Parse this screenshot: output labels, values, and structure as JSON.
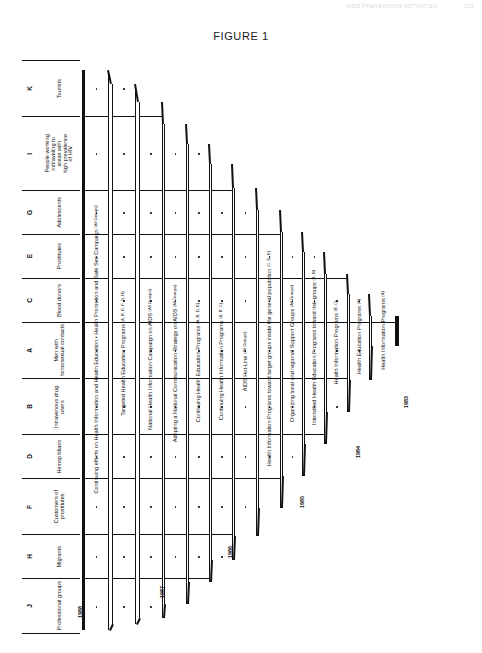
{
  "runhead": {
    "title": "AIDS PREVENTION ACTIVITIES",
    "page": "163"
  },
  "figure": {
    "caption_lead": "F",
    "caption_rest": "IGURE",
    "caption_num": "1",
    "caption_full": "FIGURE 1"
  },
  "axis": {
    "group_header_code": "Code",
    "group_header_name": "Target group",
    "groups": [
      {
        "code": "K",
        "name": "Tourists"
      },
      {
        "code": "I",
        "name": "People working in/traveling to areas with high prevalence of HIV"
      },
      {
        "code": "G",
        "name": "Adolescents"
      },
      {
        "code": "E",
        "name": "Prostitutes"
      },
      {
        "code": "C",
        "name": "Blood donors"
      },
      {
        "code": "A",
        "name": "Men with homosexual contacts"
      },
      {
        "code": "B",
        "name": "Intravenous drug users"
      },
      {
        "code": "D",
        "name": "Hemophiliacs"
      },
      {
        "code": "F",
        "name": "Customers of prostitutes"
      },
      {
        "code": "H",
        "name": "Migrants"
      },
      {
        "code": "J",
        "name": "Professional groups"
      }
    ]
  },
  "years": [
    "1988",
    "1987",
    "1986",
    "1985",
    "1984",
    "1983"
  ],
  "chart_data": {
    "type": "diagram",
    "title": "FIGURE 1",
    "xlabel": "Year",
    "ylabel": "Target groups",
    "categories": [
      "Tourists",
      "People working in/traveling to areas with high prevalence of HIV",
      "Adolescents",
      "Prostitutes",
      "Blood donors",
      "Men with homosexual contacts",
      "Intravenous drug users",
      "Hemophiliacs",
      "Customers of prostitutes",
      "Migrants",
      "Professional groups"
    ],
    "series": [
      {
        "name": "Continuing efforts on Health Information and Health Education • Health Promotion and Safe Sex Campaign",
        "groups": "All Groups",
        "year": "1988",
        "rows": 11
      },
      {
        "name": "Targeted Health Education Programs",
        "groups": "A, B, E, F, G, H",
        "year": "1988",
        "rows": 11
      },
      {
        "name": "National Health Information Campaign on AIDS",
        "groups": "All Groups",
        "year": "1987",
        "rows": 10
      },
      {
        "name": "Adopting a National Communication Strategy on AIDS",
        "groups": "All Groups",
        "year": "1987",
        "rows": 9
      },
      {
        "name": "Continuing Health Education Programs",
        "groups": "A, B, D, E",
        "year": "1987",
        "rows": 9
      },
      {
        "name": "Continuing Health Information Programs",
        "groups": "A, B, C",
        "year": "1986",
        "rows": 8
      },
      {
        "name": "AIDS Hot-Line",
        "groups": "All Groups",
        "year": "1986",
        "rows": 7
      },
      {
        "name": "Health Information Programs toward target groups inside the general population",
        "groups": "C, D, E",
        "year": "1986",
        "rows": 6
      },
      {
        "name": "Organizing local and regional Support Groups",
        "groups": "All Groups",
        "year": "1985",
        "rows": 5
      },
      {
        "name": "Intensified Health Education Programs toward risk-groups",
        "groups": "A, B",
        "year": "1985",
        "rows": 4
      },
      {
        "name": "Health Information Programs",
        "groups": "B, C",
        "year": "1984",
        "rows": 3
      },
      {
        "name": "Health Education Programs",
        "groups": "A",
        "year": "1984",
        "rows": 2
      },
      {
        "name": "Health Information Programs",
        "groups": "A",
        "year": "1983",
        "rows": 1
      }
    ]
  },
  "bands": [
    {
      "label": "Continuing efforts on Health Information and Health Education • Health Promotion and Safe Sex Campaign",
      "groups": "(All Groups)"
    },
    {
      "label": "Targeted Health Education Programs",
      "groups": "(A, B, E, F, G, H)"
    },
    {
      "label": "National Health Information Campaign on AIDS",
      "groups": "(All Groups)"
    },
    {
      "label": "Adopting a National Communication Strategy on AIDS",
      "groups": "(All Groups)"
    },
    {
      "label": "Continuing Health Education Programs",
      "groups": "(A, B, D, E)"
    },
    {
      "label": "Continuing Health Information Programs",
      "groups": "(A, B, C)"
    },
    {
      "label": "AIDS Hot-Line",
      "groups": "(All Groups)"
    },
    {
      "label": "Health Information Programs toward target groups inside the general population",
      "groups": "(C, D, E)"
    },
    {
      "label": "Organizing local and regional Support Groups",
      "groups": "(All Groups)"
    },
    {
      "label": "Intensified Health Education Programs toward risk-groups",
      "groups": "(A, B)"
    },
    {
      "label": "Health Information Programs",
      "groups": "(B, C)"
    },
    {
      "label": "Health Education Programs",
      "groups": "(A)"
    },
    {
      "label": "Health Information Programs",
      "groups": "(A)"
    }
  ]
}
